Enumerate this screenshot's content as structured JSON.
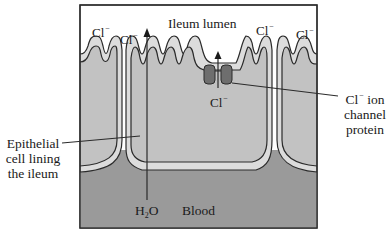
{
  "diagram": {
    "colors": {
      "lumen": "#ffffff",
      "cell": "#c2c2c2",
      "membrane_band": "#dcdcdc",
      "blood": "#9a9a9a",
      "channel_protein": "#6e6e6e",
      "outline": "#2b2b2b"
    },
    "regions": {
      "lumen_label": "Ileum lumen",
      "blood_label": "Blood"
    },
    "ions": {
      "cl_symbol": "Cl",
      "cl_charge": "−",
      "lumen_cl_count": 4
    },
    "water": {
      "h": "H",
      "sub": "2",
      "o": "O"
    },
    "callouts": {
      "epithelial": [
        "Epithelial",
        "cell lining",
        "the ileum"
      ],
      "channel": {
        "line1_ion": "Cl",
        "line1_rest": " ion",
        "line2": "channel",
        "line3": "protein"
      }
    }
  }
}
